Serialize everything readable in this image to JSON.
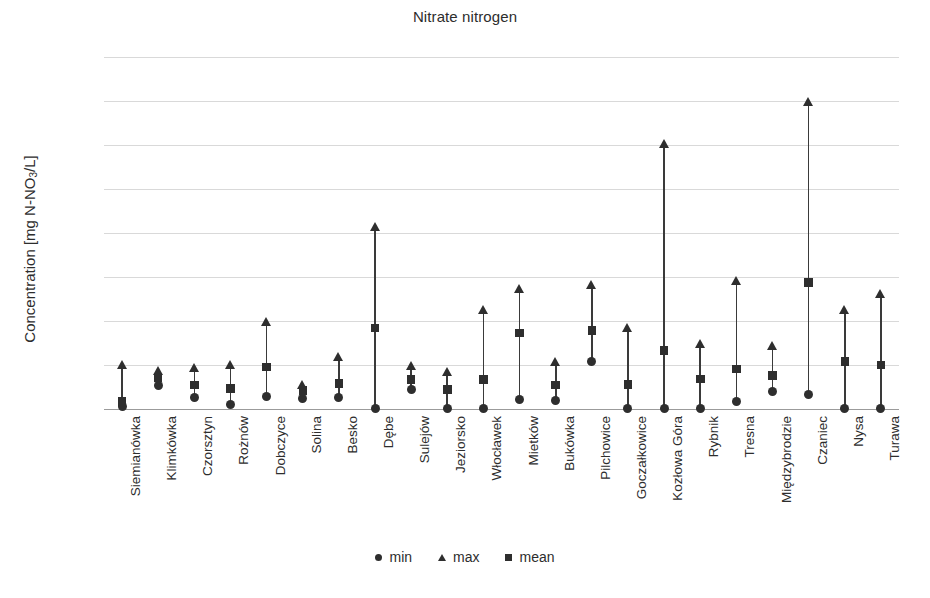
{
  "chart_data": {
    "type": "scatter",
    "title": "Nitrate nitrogen",
    "xlabel": "",
    "ylabel": "Concentration [mg N-NO3/L]",
    "ylabel_prefix": "Concentration [mg N-NO",
    "ylabel_sub": "3",
    "ylabel_suffix": "/L]",
    "ylim": [
      0.0,
      8.0
    ],
    "ytick_labels": [
      "0.0",
      "1.0",
      "2.0",
      "3.0",
      "4.0",
      "5.0",
      "6.0",
      "7.0",
      "8.0"
    ],
    "ytick_values": [
      0.0,
      1.0,
      2.0,
      3.0,
      4.0,
      5.0,
      6.0,
      7.0,
      8.0
    ],
    "grid": true,
    "legend_position": "bottom",
    "legend": [
      {
        "label": "min",
        "marker": "circle"
      },
      {
        "label": "max",
        "marker": "triangle"
      },
      {
        "label": "mean",
        "marker": "square"
      }
    ],
    "categories": [
      "Siemianówka",
      "Klimkówka",
      "Czorsztyn",
      "Rożnów",
      "Dobczyce",
      "Solina",
      "Besko",
      "Dębe",
      "Sulejów",
      "Jeziorsko",
      "Włocławek",
      "Mietków",
      "Bukówka",
      "Pilchowice",
      "Goczałkowice",
      "Kozłowa Góra",
      "Rybnik",
      "Tresna",
      "Międzybrodzie",
      "Czaniec",
      "Nysa",
      "Turawa"
    ],
    "series": [
      {
        "name": "min",
        "marker": "circle",
        "values": [
          0.05,
          0.54,
          0.27,
          0.11,
          0.29,
          0.25,
          0.27,
          0.01,
          0.44,
          0.02,
          0.01,
          0.22,
          0.2,
          1.09,
          0.01,
          0.01,
          0.02,
          0.16,
          0.4,
          0.34,
          0.02,
          0.01
        ]
      },
      {
        "name": "max",
        "marker": "triangle",
        "values": [
          0.93,
          0.8,
          0.86,
          0.93,
          1.92,
          0.48,
          1.12,
          4.07,
          0.9,
          0.78,
          2.18,
          2.67,
          1.0,
          2.74,
          1.77,
          5.95,
          1.4,
          2.85,
          1.37,
          6.9,
          2.19,
          2.55
        ]
      },
      {
        "name": "mean",
        "marker": "square",
        "values": [
          0.17,
          0.7,
          0.55,
          0.47,
          0.96,
          0.42,
          0.58,
          1.84,
          0.67,
          0.44,
          0.67,
          1.73,
          0.54,
          1.78,
          0.56,
          1.33,
          0.68,
          0.91,
          0.76,
          2.88,
          1.08,
          1.0
        ]
      }
    ]
  },
  "colors": {
    "marker": "#2e2e2e",
    "grid": "#d9d9d9",
    "axis": "#9b9b9b",
    "text": "#2d2d2d",
    "background": "#ffffff"
  }
}
